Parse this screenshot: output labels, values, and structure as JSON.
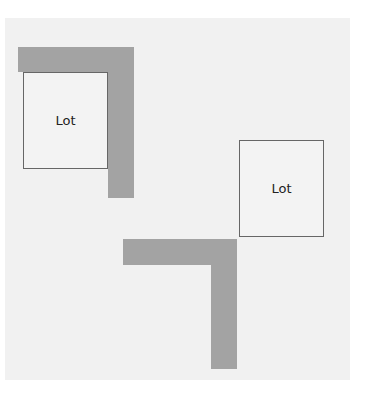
{
  "diagram": {
    "lots": [
      {
        "label": "Lot",
        "x": 23,
        "y": 72,
        "w": 85,
        "h": 97
      },
      {
        "label": "Lot",
        "x": 239,
        "y": 140,
        "w": 85,
        "h": 97
      }
    ],
    "roads": [
      {
        "name": "top-left-l-horizontal",
        "x": 18,
        "y": 47,
        "w": 116,
        "h": 25
      },
      {
        "name": "top-left-l-vertical",
        "x": 108,
        "y": 47,
        "w": 26,
        "h": 151
      },
      {
        "name": "bottom-l-horizontal",
        "x": 123,
        "y": 239,
        "w": 114,
        "h": 26
      },
      {
        "name": "bottom-l-vertical",
        "x": 211,
        "y": 239,
        "w": 26,
        "h": 130
      }
    ],
    "colors": {
      "road": "#a3a3a3",
      "background": "#f1f1f1",
      "lot_border": "#666666"
    }
  }
}
